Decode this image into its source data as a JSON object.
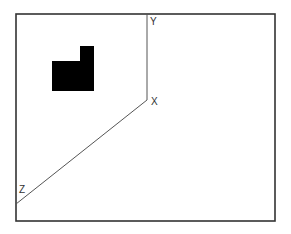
{
  "diagram": {
    "frame": {
      "x": 16,
      "y": 14,
      "width": 259,
      "height": 207,
      "stroke": "#333333"
    },
    "axes": {
      "origin_point": {
        "x": 147,
        "y": 100
      },
      "y_axis_end": {
        "x": 147,
        "y": 14
      },
      "z_axis_end": {
        "x": 16,
        "y": 204
      },
      "stroke": "#555555",
      "labels": {
        "x": "X",
        "y": "Y",
        "z": "Z"
      },
      "label_positions": {
        "x": {
          "x": 151,
          "y": 105
        },
        "y": {
          "x": 150,
          "y": 25
        },
        "z": {
          "x": 19,
          "y": 193
        }
      }
    },
    "shape": {
      "fill": "#000000",
      "points": "52,61 80,61 80,46 94,46 94,91 52,91"
    }
  }
}
